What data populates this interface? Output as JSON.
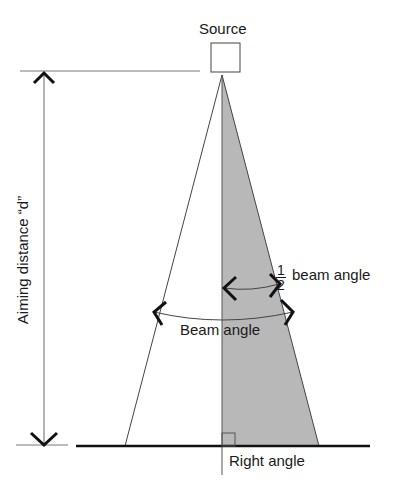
{
  "diagram": {
    "labels": {
      "source": "Source",
      "aiming_distance": "Aiming distance “d”",
      "half_beam_fraction_num": "1",
      "half_beam_fraction_den": "2",
      "half_beam_text": "beam angle",
      "beam_angle": "Beam angle",
      "right_angle": "Right angle"
    },
    "colors": {
      "line": "#1a1a1a",
      "thin_line": "#555555",
      "shaded_half": "#b8b8b8"
    }
  }
}
